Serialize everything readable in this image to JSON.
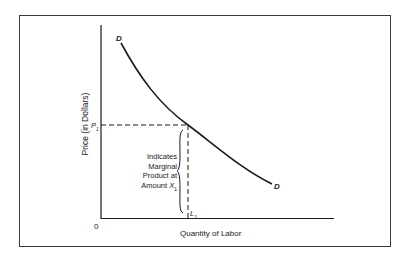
{
  "diagram": {
    "type": "labor-demand-curve",
    "y_axis_label": "Price (in Dollars)",
    "x_axis_label": "Quantity of Labor",
    "origin_label": "0",
    "price_marker": {
      "label": "P",
      "subscript": "1"
    },
    "quantity_marker": {
      "label": "L",
      "subscript": "1"
    },
    "curve_labels": {
      "start": "D",
      "end": "D"
    },
    "annotation": {
      "lines": [
        "Indicates",
        "Marginal",
        "Product at",
        "Amount"
      ],
      "variable": "X",
      "variable_subscript": "1"
    },
    "colors": {
      "line": "#1a1a1a",
      "frame": "#3a3a3a",
      "background": "#ffffff"
    }
  }
}
